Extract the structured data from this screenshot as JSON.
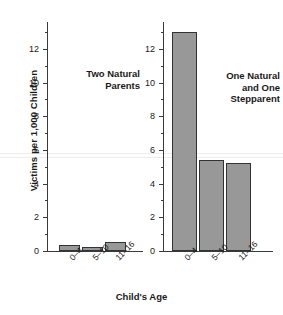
{
  "chart_data": {
    "type": "bar",
    "title": "",
    "xlabel": "Child's Age",
    "ylabel": "Victims per 1,000 Children",
    "categories": [
      "0–4",
      "5–10",
      "11–16"
    ],
    "ylim": [
      0,
      13.6
    ],
    "yticks_major": [
      0,
      2,
      4,
      6,
      8,
      10,
      12
    ],
    "yticks_minor": [
      1,
      3,
      5,
      7,
      9,
      11,
      13
    ],
    "grid": false,
    "legend_position": "none",
    "panels": [
      {
        "name": "Two Natural Parents",
        "annotation": "Two Natural\nParents",
        "values": [
          0.35,
          0.25,
          0.55
        ]
      },
      {
        "name": "One Natural and One Stepparent",
        "annotation": "One Natural\nand One\nStepparent",
        "values": [
          13.0,
          5.4,
          5.2
        ]
      }
    ],
    "series": [
      {
        "name": "Two Natural Parents",
        "values": [
          0.35,
          0.25,
          0.55
        ]
      },
      {
        "name": "One Natural and One Stepparent",
        "values": [
          13.0,
          5.4,
          5.2
        ]
      }
    ],
    "bar_fill_color": "#989898",
    "bar_edge_color": "#333333",
    "axis_color": "#3a3a3a",
    "background_color": "#ffffff"
  },
  "axis": {
    "y_title": "Victims per 1,000 Children",
    "x_title": "Child's Age",
    "y_tick_labels": [
      "0",
      "2",
      "4",
      "6",
      "8",
      "10",
      "12"
    ],
    "x_tick_labels": [
      "0–4",
      "5–10",
      "11–16"
    ]
  },
  "panel_left": {
    "annotation_line1": "Two Natural",
    "annotation_line2": "Parents"
  },
  "panel_right": {
    "annotation_line1": "One Natural",
    "annotation_line2": "and One",
    "annotation_line3": "Stepparent"
  }
}
